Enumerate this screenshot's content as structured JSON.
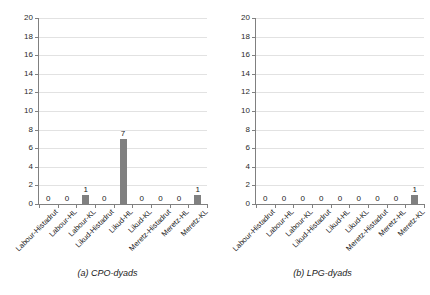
{
  "figure": {
    "panels": [
      {
        "id": "panel-a",
        "caption": "(a) CPO-dyads"
      },
      {
        "id": "panel-b",
        "caption": "(b) LPG-dyads"
      }
    ]
  },
  "axis": {
    "yticks": [
      "0",
      "2",
      "4",
      "6",
      "8",
      "10",
      "12",
      "14",
      "16",
      "18",
      "20"
    ]
  },
  "colors": {
    "bar": "#808080",
    "grid": "#e2e2e2",
    "axis": "#808080",
    "text": "#1a1a1a",
    "background": "#ffffff"
  },
  "chart_data": [
    {
      "type": "bar",
      "title": "(a) CPO-dyads",
      "xlabel": "",
      "ylabel": "",
      "ylim": [
        0,
        20
      ],
      "ytick_step": 2,
      "grid": true,
      "legend": "none",
      "categories": [
        "Labour-Histadrut",
        "Labour-HL",
        "Labour-KL",
        "Likud-Histadrut",
        "Likud-HL",
        "Likud-KL",
        "Meretz-Histadrut",
        "Meretz-HL",
        "Meretz-KL"
      ],
      "values": [
        0,
        0,
        1,
        0,
        7,
        0,
        0,
        0,
        1
      ],
      "data_labels": [
        "0",
        "0",
        "1",
        "0",
        "7",
        "0",
        "0",
        "0",
        "1"
      ]
    },
    {
      "type": "bar",
      "title": "(b) LPG-dyads",
      "xlabel": "",
      "ylabel": "",
      "ylim": [
        0,
        20
      ],
      "ytick_step": 2,
      "grid": true,
      "legend": "none",
      "categories": [
        "Labour-Histadrut",
        "Labour-HL",
        "Labour-KL",
        "Likud-Histadrut",
        "Likud-HL",
        "Likud-KL",
        "Meretz-Histadrut",
        "Meretz-HL",
        "Meretz-KL"
      ],
      "values": [
        0,
        0,
        0,
        0,
        0,
        0,
        0,
        0,
        1
      ],
      "data_labels": [
        "0",
        "0",
        "0",
        "0",
        "0",
        "0",
        "0",
        "0",
        "1"
      ]
    }
  ]
}
